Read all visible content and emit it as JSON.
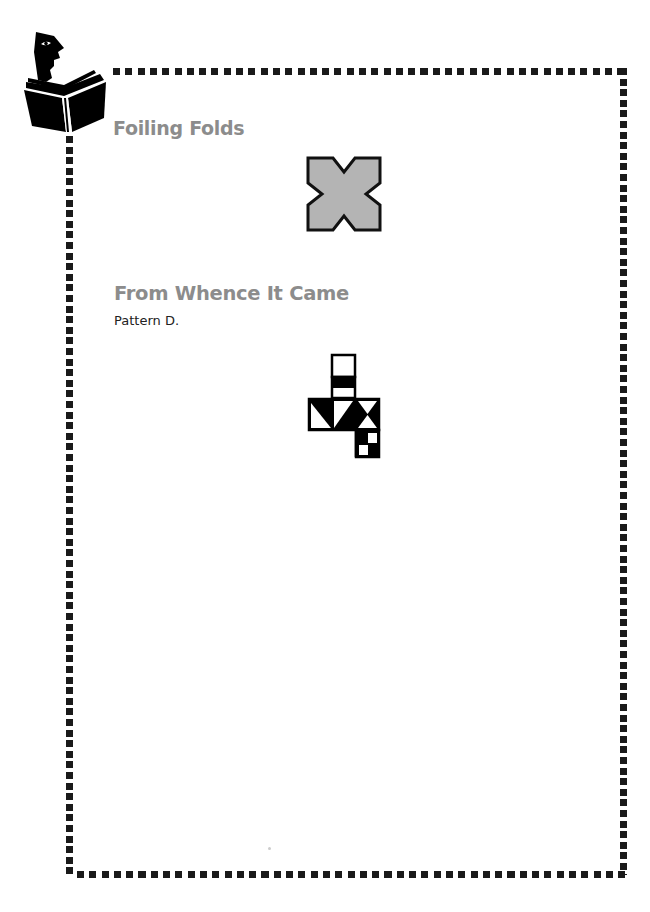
{
  "page": {
    "sections": [
      {
        "title": "Foiling Folds",
        "figure": {
          "name": "cross-shape",
          "fill": "#b4b4b4",
          "stroke": "#111111"
        }
      },
      {
        "title": "From Whence It Came",
        "body": "Pattern D.",
        "figure": {
          "name": "cube-net-pattern-d",
          "fill": "#000000",
          "background": "#ffffff"
        }
      }
    ],
    "colors": {
      "heading": "#8c8c8c",
      "border_dots": "#1a1a1a",
      "text": "#222222"
    },
    "icons": {
      "logo": "reading-man-icon"
    }
  }
}
